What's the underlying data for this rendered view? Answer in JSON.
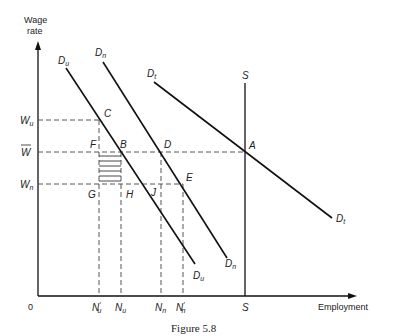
{
  "diagram": {
    "caption": "Figure 5.8",
    "y_axis_label_line1": "Wage",
    "y_axis_label_line2": "rate",
    "x_axis_label": "Employment",
    "origin_label": "0",
    "wage_levels": {
      "Wu": {
        "base": "W",
        "sub": "u"
      },
      "Wbar": {
        "base": "W"
      },
      "Wn": {
        "base": "W",
        "sub": "n"
      }
    },
    "employment_levels": {
      "Nu_prime": {
        "base": "N",
        "sub": "u",
        "prime": "′"
      },
      "Nu": {
        "base": "N",
        "sub": "u"
      },
      "Nn": {
        "base": "N",
        "sub": "n"
      },
      "Nn_prime": {
        "base": "N",
        "sub": "n",
        "prime": "′"
      },
      "S": "S"
    },
    "curves": {
      "Du": {
        "base": "D",
        "sub": "u"
      },
      "Dn": {
        "base": "D",
        "sub": "n"
      },
      "Dt": {
        "base": "D",
        "sub": "t"
      },
      "S": "S"
    },
    "points": {
      "A": "A",
      "B": "B",
      "C": "C",
      "D": "D",
      "E": "E",
      "F": "F",
      "G": "G",
      "H": "H",
      "J": "J"
    },
    "line_color": "#111111",
    "dash_color": "#555555"
  }
}
